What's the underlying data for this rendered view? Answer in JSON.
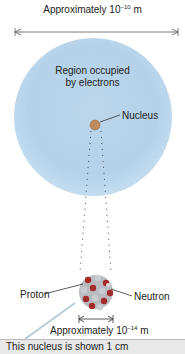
{
  "diagram": {
    "title_span": {
      "text": "Approximately 10",
      "exponent": "−10",
      "unit": " m"
    },
    "electron_region": {
      "line1": "Region occupied",
      "line2": "by electrons"
    },
    "nucleus_label": "Nucleus",
    "proton_label": "Proton",
    "neutron_label": "Neutron",
    "nucleus_span": {
      "text": "Approximately 10",
      "exponent": "−14",
      "unit": " m"
    },
    "callout": "This nucleus is shown 1 cm"
  },
  "colors": {
    "electron_cloud": "#b4d2ea",
    "proton": "#a52a2a",
    "neutron": "#c0c4c8",
    "nucleus_small": "#c08a5a",
    "callout_bg": "#e8e8e8"
  }
}
